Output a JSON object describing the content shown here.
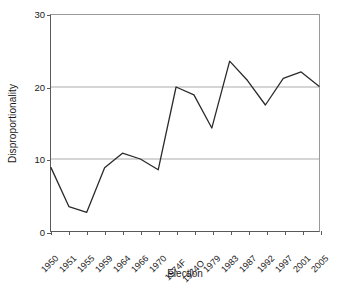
{
  "chart_data": {
    "type": "line",
    "title": "",
    "subtitle": "",
    "xlabel": "Election",
    "ylabel": "Disproportionality",
    "categories": [
      "1950",
      "1951",
      "1955",
      "1959",
      "1964",
      "1966",
      "1970",
      "1974F",
      "1974O",
      "1979",
      "1983",
      "1987",
      "1992",
      "1997",
      "2001",
      "2005"
    ],
    "values": [
      8.8,
      3.4,
      2.6,
      8.8,
      10.8,
      10.0,
      8.5,
      20.0,
      18.9,
      14.3,
      23.6,
      20.9,
      17.5,
      21.2,
      22.1,
      20.1
    ],
    "series": [
      {
        "name": "Disproportionality",
        "values": [
          8.8,
          3.4,
          2.6,
          8.8,
          10.8,
          10.0,
          8.5,
          20.0,
          18.9,
          14.3,
          23.6,
          20.9,
          17.5,
          21.2,
          22.1,
          20.1
        ]
      }
    ],
    "ylim": [
      0,
      30
    ],
    "yticks": [
      0,
      10,
      20,
      30
    ],
    "ytick_labels": [
      "0",
      "10",
      "20",
      "30"
    ],
    "grid": "horizontal",
    "grid_color": "#aaaaaa",
    "legend": "none",
    "line_color": "#2b2b2b",
    "line_width": 1.3,
    "markers": "none",
    "axis_color": "#5a5a5a",
    "frame_color": "#9a9a9a",
    "background": "#ffffff"
  }
}
